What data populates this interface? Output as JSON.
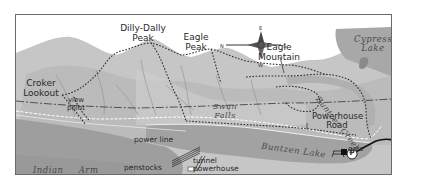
{
  "map": {
    "type": "trail map",
    "compass": {
      "N": "N",
      "E": "E",
      "S": "S",
      "W": "W"
    },
    "peaks": [
      {
        "name_line1": "Dilly-Dally",
        "name_line2": "Peak"
      },
      {
        "name_line1": "Eagle",
        "name_line2": "Peak"
      },
      {
        "name_line1": "Eagle",
        "name_line2": "Mountain"
      }
    ],
    "lookout": {
      "line1": "Croker",
      "line2": "Lookout"
    },
    "viewpoint": {
      "line1": "view",
      "line2": "point"
    },
    "features": {
      "swan_falls": {
        "line1": "Swan",
        "line2": "Falls"
      },
      "power_line": "power line",
      "powerhouse_road": {
        "line1": "Powerhouse",
        "line2": "Road"
      },
      "gate": "gate",
      "penstocks": "penstocks",
      "tunnel_powerhouse": {
        "line1": "tunnel",
        "line2": "powerhouse"
      },
      "parking": "P"
    },
    "water": {
      "cypress_lake": {
        "line1": "Cypress",
        "line2": "Lake"
      },
      "buntzen_creek": "Buntzen Creek",
      "buntzen_lake": "Buntzen Lake",
      "indian_arm": "Indian Arm"
    },
    "colors": {
      "water": "#a9a9a9",
      "land_light": "#d4d4d4",
      "land_mid": "#bdbdbd",
      "ridge": "#9a9a9a",
      "trail": "#333333",
      "road": "#ffffff"
    }
  }
}
